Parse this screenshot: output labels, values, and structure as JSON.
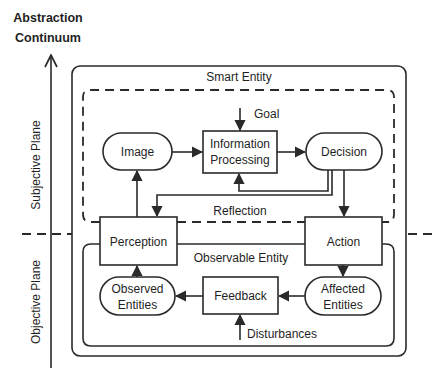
{
  "axis": {
    "title_line1": "Abstraction",
    "title_line2": "Continuum",
    "upper_plane": "Subjective Plane",
    "lower_plane": "Objective Plane"
  },
  "regions": {
    "smart_entity": "Smart Entity",
    "observable_entity": "Observable Entity",
    "reflection": "Reflection"
  },
  "inputs": {
    "goal": "Goal",
    "disturbances": "Disturbances"
  },
  "nodes": {
    "image": "Image",
    "info_processing_line1": "Information",
    "info_processing_line2": "Processing",
    "decision": "Decision",
    "perception": "Perception",
    "action": "Action",
    "observed_line1": "Observed",
    "observed_line2": "Entities",
    "feedback": "Feedback",
    "affected_line1": "Affected",
    "affected_line2": "Entities"
  },
  "edges": [
    {
      "from": "Goal",
      "to": "Information Processing"
    },
    {
      "from": "Image",
      "to": "Information Processing"
    },
    {
      "from": "Information Processing",
      "to": "Decision"
    },
    {
      "from": "Decision",
      "to": "Information Processing",
      "label": "Reflection"
    },
    {
      "from": "Decision",
      "to": "Perception"
    },
    {
      "from": "Decision",
      "to": "Action"
    },
    {
      "from": "Perception",
      "to": "Image"
    },
    {
      "from": "Action",
      "to": "Affected Entities"
    },
    {
      "from": "Affected Entities",
      "to": "Feedback"
    },
    {
      "from": "Feedback",
      "to": "Observed Entities"
    },
    {
      "from": "Observed Entities",
      "to": "Perception"
    },
    {
      "from": "Disturbances",
      "to": "Feedback"
    }
  ],
  "colors": {
    "stroke": "#2a2a2a",
    "background": "#ffffff"
  }
}
